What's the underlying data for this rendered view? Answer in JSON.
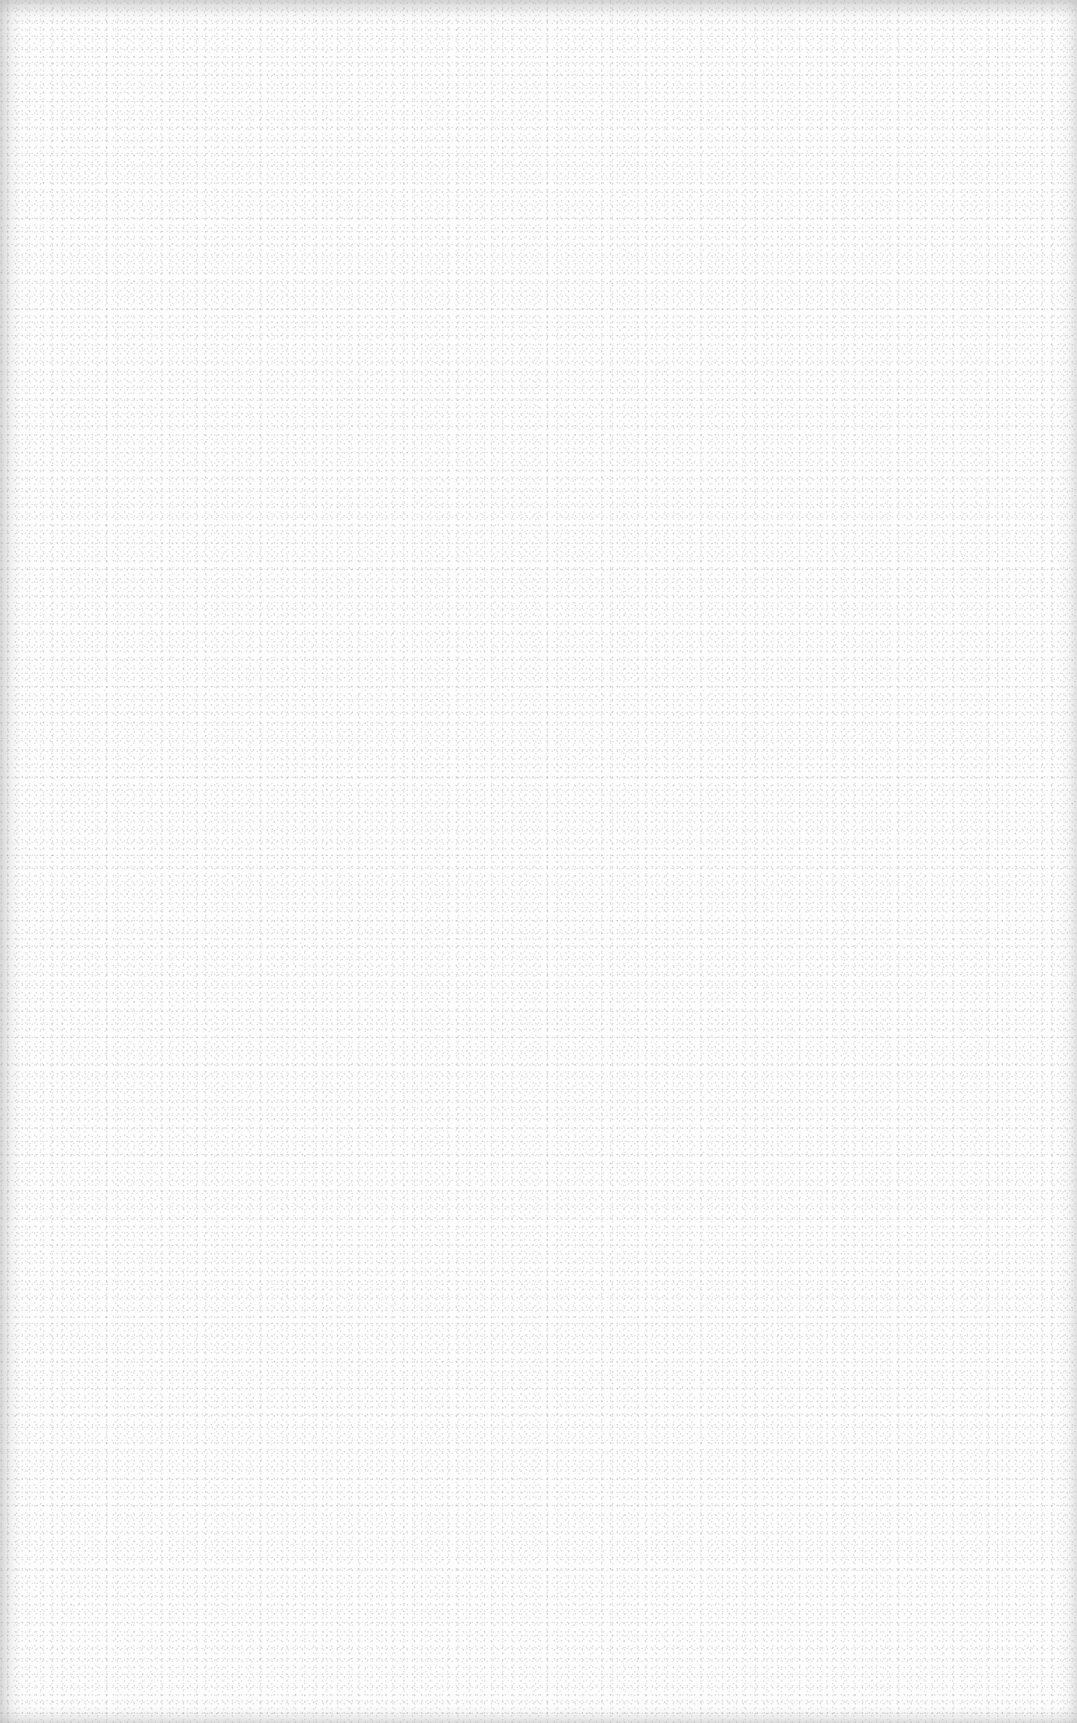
{
  "document": {
    "type": "blank-scanned-page",
    "text": "",
    "colors": {
      "paper": "#fdfdfd",
      "speckle": "#9a9a9a",
      "edge_shade": "#c8c8c8"
    }
  }
}
